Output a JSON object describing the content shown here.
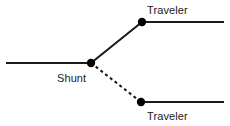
{
  "diagram": {
    "background_color": "#ffffff",
    "line_color": "#1a1a1a",
    "node_color": "#000000",
    "labels": {
      "traveler_top": "Traveler",
      "shunt": "Shunt",
      "traveler_bottom": "Traveler"
    },
    "nodes": [
      {
        "name": "shunt-node",
        "x": 91,
        "y": 63,
        "radius": 4.2
      },
      {
        "name": "traveler-top-node",
        "x": 142,
        "y": 22,
        "radius": 4.2
      },
      {
        "name": "traveler-bottom-node",
        "x": 141,
        "y": 102,
        "radius": 4.2
      }
    ],
    "segments": [
      {
        "name": "shunt-lead-wire",
        "style": "solid",
        "x1": 6,
        "y1": 63,
        "x2": 91,
        "y2": 63
      },
      {
        "name": "shunt-to-traveler-top-wire",
        "style": "solid",
        "x1": 91,
        "y1": 63,
        "x2": 142,
        "y2": 22
      },
      {
        "name": "shunt-to-traveler-bottom-wire",
        "style": "dashed",
        "x1": 91,
        "y1": 63,
        "x2": 141,
        "y2": 102
      },
      {
        "name": "traveler-top-lead-wire",
        "style": "solid",
        "x1": 142,
        "y1": 22,
        "x2": 224,
        "y2": 22
      },
      {
        "name": "traveler-bottom-lead-wire",
        "style": "solid",
        "x1": 141,
        "y1": 102,
        "x2": 224,
        "y2": 102
      }
    ],
    "dash_pattern": "3 3",
    "stroke_width": 2
  }
}
